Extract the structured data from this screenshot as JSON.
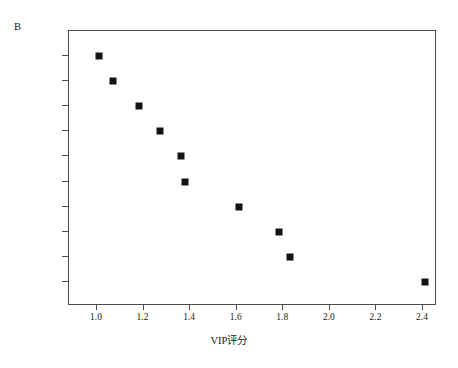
{
  "figure": {
    "panel_label": "B",
    "background_color": "#ffffff",
    "frame_color": "#4d4d4d",
    "marker_color": "#141414"
  },
  "chart_data": {
    "type": "scatter",
    "title": "",
    "subtitle": "",
    "panel": "B",
    "xlabel": "VIP评分",
    "ylabel": "",
    "orientation": "horizontal",
    "marker": "filled-square",
    "grid": false,
    "legend": null,
    "xlim": [
      0.88,
      2.46
    ],
    "xticks": [
      1.0,
      1.2,
      1.4,
      1.6,
      1.8,
      2.0,
      2.2,
      2.4
    ],
    "xticklabels": [
      "1.0",
      "1.2",
      "1.4",
      "1.6",
      "1.8",
      "2.0",
      "2.2",
      "2.4"
    ],
    "categories": [
      "Cr",
      "Md",
      "Ca",
      "Mo",
      "Mg",
      "Yb",
      "Li",
      "B",
      "Sc",
      "Zr"
    ],
    "values": [
      1.01,
      1.07,
      1.18,
      1.27,
      1.36,
      1.38,
      1.61,
      1.78,
      1.83,
      2.41
    ],
    "points": [
      {
        "label": "Cr",
        "value": 1.01
      },
      {
        "label": "Md",
        "value": 1.07
      },
      {
        "label": "Ca",
        "value": 1.18
      },
      {
        "label": "Mo",
        "value": 1.27
      },
      {
        "label": "Mg",
        "value": 1.36
      },
      {
        "label": "Yb",
        "value": 1.38
      },
      {
        "label": "Li",
        "value": 1.61
      },
      {
        "label": "B",
        "value": 1.78
      },
      {
        "label": "Sc",
        "value": 1.83
      },
      {
        "label": "Zr",
        "value": 2.41
      }
    ]
  }
}
